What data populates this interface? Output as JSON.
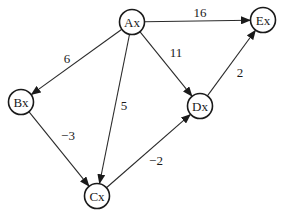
{
  "diagram": {
    "type": "weighted directed graph",
    "nodes": [
      {
        "id": "A",
        "label": "Ax",
        "x": 132,
        "y": 22
      },
      {
        "id": "B",
        "label": "Bx",
        "x": 21,
        "y": 102
      },
      {
        "id": "C",
        "label": "Cx",
        "x": 97,
        "y": 196
      },
      {
        "id": "D",
        "label": "Dx",
        "x": 200,
        "y": 106
      },
      {
        "id": "E",
        "label": "Ex",
        "x": 263,
        "y": 20
      }
    ],
    "edges": [
      {
        "from": "A",
        "to": "E",
        "weight": "16",
        "lx": 200,
        "ly": 12
      },
      {
        "from": "A",
        "to": "B",
        "weight": "6",
        "lx": 67,
        "ly": 58
      },
      {
        "from": "A",
        "to": "D",
        "weight": "11",
        "lx": 176,
        "ly": 52
      },
      {
        "from": "A",
        "to": "C",
        "weight": "5",
        "lx": 124,
        "ly": 105
      },
      {
        "from": "D",
        "to": "E",
        "weight": "2",
        "lx": 240,
        "ly": 72
      },
      {
        "from": "B",
        "to": "C",
        "weight": "−3",
        "lx": 68,
        "ly": 135
      },
      {
        "from": "C",
        "to": "D",
        "weight": "−2",
        "lx": 156,
        "ly": 160
      }
    ],
    "colors": {
      "stroke": "#1a1a1a",
      "background": "#ffffff"
    }
  }
}
